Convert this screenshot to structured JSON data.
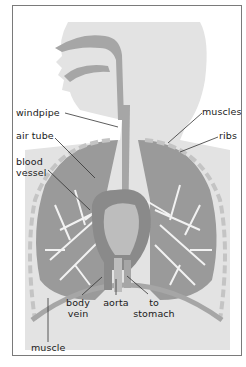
{
  "diagram": {
    "title": "",
    "colors": {
      "head": "#e3e3e3",
      "airway": "#a6a6a6",
      "lung": "#9a9a9a",
      "lung_branches": "#f2f2f2",
      "heart": "#8a8a8a",
      "heart_light": "#bdbdbd",
      "ribs": "#c4c4c4",
      "frame": "#7a7a7a",
      "leader": "#333333"
    },
    "labels": {
      "windpipe": "windpipe",
      "muscles": "muscles",
      "air_tube": "air tube",
      "ribs": "ribs",
      "blood_vessel_line1": "blood",
      "blood_vessel_line2": "vessel",
      "body_vein_line1": "body",
      "body_vein_line2": "vein",
      "aorta": "aorta",
      "to_stomach_line1": "to",
      "to_stomach_line2": "stomach",
      "muscle": "muscle"
    }
  }
}
